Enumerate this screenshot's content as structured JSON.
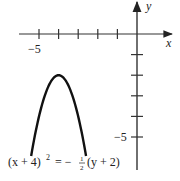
{
  "chart_data": {
    "type": "line",
    "title": "",
    "xlabel": "x",
    "ylabel": "y",
    "equation": "(x + 4)^2 = -1/2 (y + 2)",
    "equation_parts": {
      "left": "(x + 4)",
      "exponent": "2",
      "equals": "= −",
      "frac_num": "1",
      "frac_den": "2",
      "right": "(y + 2)"
    },
    "xlim": [
      -6.1,
      1.9
    ],
    "ylim": [
      -6.5,
      1.7
    ],
    "x_ticks": [
      -5,
      -4,
      -3,
      -2,
      -1
    ],
    "y_ticks": [
      -1,
      -2,
      -3,
      -4,
      -5
    ],
    "x_tick_labels": [
      {
        "value": -5,
        "label": "−5"
      }
    ],
    "y_tick_labels": [
      {
        "value": -5,
        "label": "−5"
      }
    ],
    "grid": false,
    "series": [
      {
        "name": "parabola",
        "vertex": [
          -4,
          -2
        ],
        "opens": "down",
        "x": [
          -5.4,
          -5.2,
          -5.0,
          -4.8,
          -4.6,
          -4.4,
          -4.2,
          -4.0,
          -3.8,
          -3.6,
          -3.4,
          -3.2,
          -3.0,
          -2.8,
          -2.6
        ],
        "y": [
          -5.92,
          -4.88,
          -4.0,
          -3.28,
          -2.72,
          -2.32,
          -2.08,
          -2.0,
          -2.08,
          -2.32,
          -2.72,
          -3.28,
          -4.0,
          -4.88,
          -5.92
        ]
      }
    ]
  },
  "axes": {
    "x_label": "x",
    "y_label": "y",
    "x_tick_label_neg5": "−5",
    "y_tick_label_neg5": "−5"
  }
}
